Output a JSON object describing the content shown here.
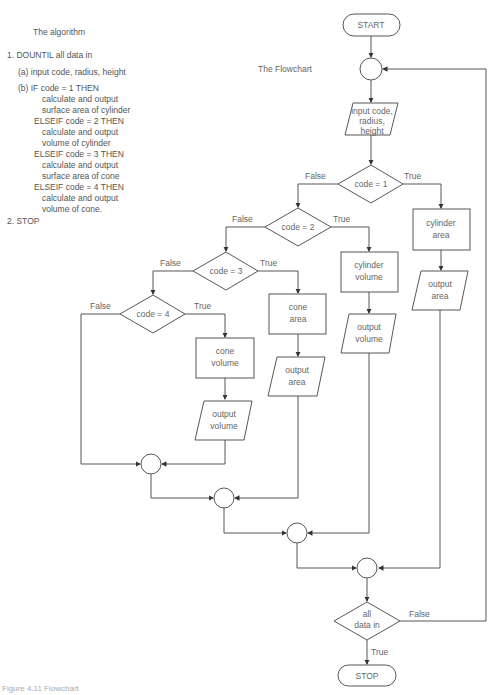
{
  "algorithm": {
    "title": "The algorithm",
    "lines": [
      "1.  DOUNTIL all data in",
      "(a)  input code, radius, height",
      "(b)  IF code  =  1 THEN",
      "calculate and output",
      "surface area of cylinder",
      "ELSEIF code  =  2 THEN",
      "calculate and output",
      "volume of cylinder",
      "ELSEIF code  =  3 THEN",
      "calculate and output",
      "surface area of cone",
      "ELSEIF code  =  4 THEN",
      "calculate and output",
      "volume of cone.",
      "2.  STOP"
    ]
  },
  "flowchart": {
    "title": "The Flowchart",
    "start": "START",
    "stop": "STOP",
    "input": [
      "input code,",
      "radius,",
      "height"
    ],
    "decisions": {
      "d1": "code = 1",
      "d2": "code = 2",
      "d3": "code = 3",
      "d4": "code = 4",
      "loop": [
        "all",
        "data in"
      ]
    },
    "processes": {
      "cylinder_area": [
        "cylinder",
        "area"
      ],
      "cylinder_volume": [
        "cylinder",
        "volume"
      ],
      "cone_area": [
        "cone",
        "area"
      ],
      "cone_volume": [
        "cone",
        "volume"
      ]
    },
    "outputs": {
      "out_cyl_area": [
        "output",
        "area"
      ],
      "out_cyl_volume": [
        "output",
        "volume"
      ],
      "out_cone_area": [
        "output",
        "area"
      ],
      "out_cone_volume": [
        "output",
        "volume"
      ]
    },
    "labels": {
      "true": "True",
      "false": "False"
    }
  },
  "caption": "Figure 4.11  Flowchart"
}
